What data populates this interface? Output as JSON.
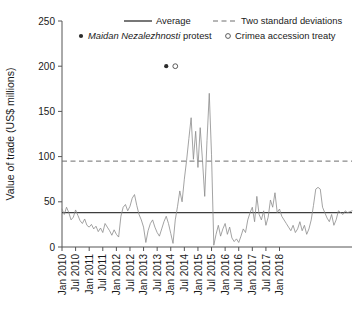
{
  "chart_data": {
    "type": "line",
    "title": "",
    "xlabel": "",
    "ylabel": "Value of trade (US$ millions)",
    "ylim": [
      0,
      250
    ],
    "yticks": [
      0,
      50,
      100,
      150,
      200,
      250
    ],
    "ytick_labels": [
      "0",
      "50",
      "100",
      "150",
      "200",
      "250"
    ],
    "grid": false,
    "legend_position": "top",
    "x_start": "Jan 2010",
    "x_end": "Jan 2018",
    "x_step_months": 1,
    "xtick_labels": [
      "Jan 2010",
      "Jul 2010",
      "Jan 2011",
      "Jul 2011",
      "Jan 2012",
      "Jul 2012",
      "Jan 2013",
      "Jul 2013",
      "Jan 2014",
      "Jul 2014",
      "Jan 2015",
      "Jul 2015",
      "Jan 2016",
      "Jul 2016",
      "Jan 2017",
      "Jul 2017",
      "Jan 2018"
    ],
    "series": [
      {
        "name": "Monthly value of trade",
        "type": "line",
        "color": "#8c8c8c",
        "values": [
          42,
          36,
          44,
          38,
          30,
          33,
          41,
          35,
          29,
          26,
          31,
          24,
          22,
          25,
          20,
          23,
          17,
          21,
          16,
          26,
          22,
          18,
          13,
          19,
          14,
          11,
          34,
          44,
          47,
          40,
          45,
          54,
          58,
          46,
          36,
          30,
          22,
          5,
          18,
          26,
          30,
          22,
          16,
          12,
          20,
          28,
          34,
          26,
          15,
          4,
          30,
          45,
          62,
          50,
          75,
          96,
          120,
          143,
          97,
          128,
          88,
          132,
          96,
          56,
          118,
          170,
          102,
          2,
          14,
          24,
          12,
          20,
          26,
          14,
          22,
          10,
          6,
          9,
          5,
          12,
          20,
          16,
          30,
          38,
          44,
          28,
          56,
          36,
          30,
          40,
          24,
          33,
          52,
          44,
          60,
          38,
          42,
          34,
          30,
          26,
          22,
          18,
          24,
          16,
          20,
          28,
          18,
          24,
          14,
          20,
          30,
          46,
          64,
          66,
          64,
          44,
          38,
          32,
          28,
          36,
          24,
          30,
          40,
          38,
          36,
          40,
          38,
          39,
          40
        ]
      }
    ],
    "reference_lines": [
      {
        "name": "Average",
        "label": "Average",
        "value": 38,
        "style": "solid",
        "color": "#3d3d3d"
      },
      {
        "name": "Two standard deviations",
        "label": "Two standard deviations",
        "value": 95,
        "style": "dashed",
        "color": "#6e6e6e"
      }
    ],
    "event_markers": [
      {
        "name": "Maidan Nezalezhnosti protest",
        "label_italic": "Maidan Nezalezhnosti",
        "label_plain": "protest",
        "marker": "filled-circle",
        "x_label": "Nov 2013",
        "x_index": 46,
        "y": 200,
        "color": "#2b2b2b"
      },
      {
        "name": "Crimea accession treaty",
        "label_italic": "",
        "label_plain": "Crimea accession treaty",
        "marker": "open-circle",
        "x_label": "Mar 2014",
        "x_index": 50,
        "y": 200,
        "color": "#4a4a4a"
      }
    ],
    "legend": [
      {
        "label": "Average",
        "marker": "solid-line"
      },
      {
        "label": "Two standard deviations",
        "marker": "dashed-line"
      },
      {
        "label_italic": "Maidan Nezalezhnosti",
        "label": "protest",
        "marker": "filled-circle"
      },
      {
        "label": "Crimea accession treaty",
        "marker": "open-circle"
      }
    ]
  }
}
